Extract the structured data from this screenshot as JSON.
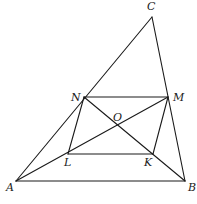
{
  "diagram": {
    "type": "geometry",
    "points": {
      "A": {
        "label": "A",
        "x": 16,
        "y": 181,
        "lx": 6,
        "ly": 191
      },
      "B": {
        "label": "B",
        "x": 185,
        "y": 181,
        "lx": 188,
        "ly": 191
      },
      "C": {
        "label": "C",
        "x": 152,
        "y": 17,
        "lx": 147,
        "ly": 10
      },
      "N": {
        "label": "N",
        "x": 84,
        "y": 97,
        "lx": 71,
        "ly": 101
      },
      "M": {
        "label": "M",
        "x": 168,
        "y": 97,
        "lx": 173,
        "ly": 101
      },
      "L": {
        "label": "L",
        "x": 68,
        "y": 154,
        "lx": 64,
        "ly": 166
      },
      "K": {
        "label": "K",
        "x": 153,
        "y": 154,
        "lx": 144,
        "ly": 166
      },
      "O": {
        "label": "O",
        "x": 117,
        "y": 125,
        "lx": 113,
        "ly": 121
      }
    },
    "segments": [
      [
        "A",
        "B"
      ],
      [
        "B",
        "C"
      ],
      [
        "C",
        "A"
      ],
      [
        "N",
        "M"
      ],
      [
        "L",
        "K"
      ],
      [
        "N",
        "L"
      ],
      [
        "M",
        "K"
      ],
      [
        "A",
        "M"
      ],
      [
        "N",
        "B"
      ]
    ]
  }
}
